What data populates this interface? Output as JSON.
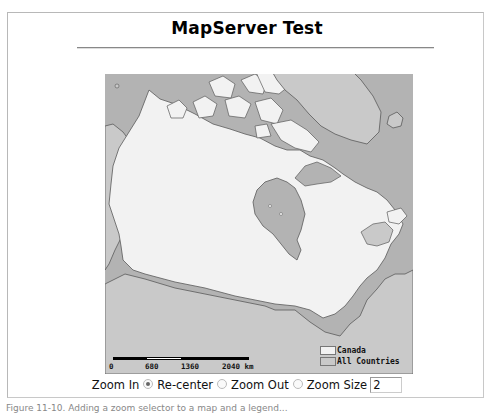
{
  "page": {
    "title": "MapServer Test"
  },
  "map": {
    "colors": {
      "ocean": "#b3b3b3",
      "countries": "#c9c9c9",
      "canada": "#f2f2f2",
      "border": "#5a5a5a"
    },
    "scalebar": {
      "labels": [
        "0",
        "680",
        "1360",
        "2040 km"
      ]
    },
    "legend": [
      {
        "label": "Canada",
        "color": "#f2f2f2"
      },
      {
        "label": "All Countries",
        "color": "#c9c9c9"
      }
    ]
  },
  "controls": {
    "zoom_in_label": "Zoom In",
    "recenter_label": "Re-center",
    "zoom_out_label": "Zoom Out",
    "zoom_size_label": "Zoom Size",
    "zoom_size_value": "2",
    "selected_mode": "Zoom In"
  },
  "caption": "Figure 11-10. Adding a zoom selector to a map and a legend..."
}
